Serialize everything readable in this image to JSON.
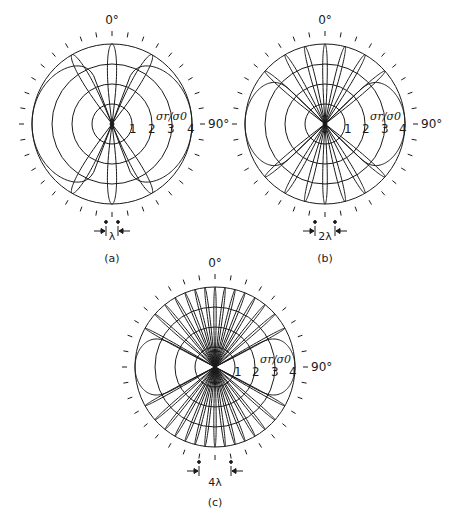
{
  "figure": {
    "ink_color": "#1a1a1a",
    "background": "#ffffff",
    "panels": [
      {
        "id": "a",
        "caption": "(a)",
        "center": [
          112,
          124
        ],
        "radius": 80,
        "ring_labels": [
          "1",
          "2",
          "3",
          "4"
        ],
        "angle_label_top": "0°",
        "angle_label_right": "90°",
        "ratio_label": "σr/σ0",
        "spacing_label": "λ",
        "spacing_half_width": 6,
        "lobe_angles_deg": [
          0,
          30,
          -30,
          150,
          -150,
          180
        ],
        "lobe_half_width_deg": 7,
        "side_lobe_half_width_deg": 22,
        "caption_y": 258
      },
      {
        "id": "b",
        "caption": "(b)",
        "center": [
          325,
          124
        ],
        "radius": 80,
        "ring_labels": [
          "1",
          "2",
          "3",
          "4"
        ],
        "angle_label_top": "0°",
        "angle_label_right": "90°",
        "ratio_label": "σr/σ0",
        "spacing_label": "2λ",
        "spacing_half_width": 10,
        "lobe_angles_deg": [
          0,
          14.5,
          -14.5,
          30,
          -30,
          48.6,
          -48.6,
          180,
          165.5,
          -165.5,
          150,
          -150,
          131.4,
          -131.4
        ],
        "lobe_half_width_deg": 3.5,
        "side_lobe_half_width_deg": 14,
        "caption_y": 258
      },
      {
        "id": "c",
        "caption": "(c)",
        "center": [
          215,
          367
        ],
        "radius": 80,
        "ring_labels": [
          "1",
          "2",
          "3",
          "4"
        ],
        "angle_label_top": "0°",
        "angle_label_right": "90°",
        "ratio_label": "σr/σ0",
        "spacing_label": "4λ",
        "spacing_half_width": 16,
        "lobe_angles_deg": [
          0,
          7.2,
          -7.2,
          14.5,
          -14.5,
          22,
          -22,
          30,
          -30,
          38.7,
          -38.7,
          48.6,
          -48.6,
          61,
          -61,
          180,
          172.8,
          -172.8,
          165.5,
          -165.5,
          158,
          -158,
          150,
          -150,
          141.3,
          -141.3,
          131.4,
          -131.4,
          119,
          -119
        ],
        "lobe_half_width_deg": 1.8,
        "side_lobe_half_width_deg": 9,
        "caption_y": 502
      }
    ]
  }
}
